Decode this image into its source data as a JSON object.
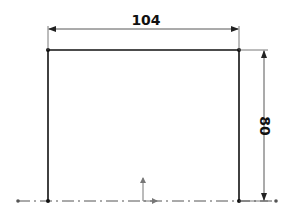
{
  "sketch": {
    "rectangle": {
      "left": 48,
      "right": 239,
      "top": 50,
      "bottom": 201
    },
    "colors": {
      "geometry": "#111111",
      "dimension": "#444444",
      "centerline": "#555555",
      "origin": "#777777"
    },
    "centerline": {
      "x1": 18,
      "x2": 276,
      "y": 201
    }
  },
  "dimensions": {
    "horizontal": {
      "label": "104",
      "value": 104
    },
    "vertical": {
      "label": "80",
      "value": 80
    }
  }
}
